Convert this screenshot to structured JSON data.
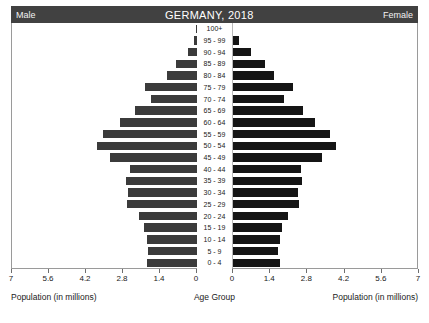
{
  "header": {
    "left_label": "Male",
    "title": "GERMANY, 2018",
    "right_label": "Female"
  },
  "footer": {
    "left_caption": "Population (in millions)",
    "center_caption": "Age Group",
    "right_caption": "Population (in millions)"
  },
  "axis": {
    "left_ticks": [
      "7",
      "5.6",
      "4.2",
      "2.8",
      "1.4",
      "0"
    ],
    "right_ticks": [
      "0",
      "1.4",
      "2.8",
      "4.2",
      "5.6",
      "7"
    ],
    "max": 7,
    "tick_step": 1.4
  },
  "colors": {
    "male_bar": "#3b3b3b",
    "female_bar": "#151515",
    "header_bg": "#414141",
    "frame": "#9a9a9a",
    "page_bg": "#ffffff"
  },
  "chart_data": {
    "type": "bar",
    "title": "GERMANY, 2018",
    "subtitle": "",
    "xlabel": "Population (in millions)",
    "ylabel": "Age Group",
    "xlim": [
      0,
      7
    ],
    "grid": false,
    "legend_position": "header",
    "orientation": "horizontal",
    "layout": "population-pyramid",
    "categories": [
      "100+",
      "95 - 99",
      "90 - 94",
      "85 - 89",
      "80 - 84",
      "75 - 79",
      "70 - 74",
      "65 - 69",
      "60 - 64",
      "55 - 59",
      "50 - 54",
      "45 - 49",
      "40 - 44",
      "35 - 39",
      "30 - 34",
      "25 - 29",
      "20 - 24",
      "15 - 19",
      "10 - 14",
      "5 - 9",
      "0 - 4"
    ],
    "series": [
      {
        "name": "Male",
        "side": "left",
        "color": "#3b3b3b",
        "values": [
          0.02,
          0.12,
          0.35,
          0.78,
          1.15,
          1.95,
          1.75,
          2.35,
          2.9,
          3.55,
          3.8,
          3.3,
          2.55,
          2.7,
          2.6,
          2.65,
          2.2,
          2.0,
          1.9,
          1.85,
          1.9
        ]
      },
      {
        "name": "Female",
        "side": "right",
        "color": "#151515",
        "values": [
          0.05,
          0.28,
          0.7,
          1.25,
          1.6,
          2.3,
          1.95,
          2.7,
          3.15,
          3.7,
          3.95,
          3.4,
          2.6,
          2.65,
          2.5,
          2.55,
          2.1,
          1.9,
          1.8,
          1.75,
          1.8
        ]
      }
    ]
  }
}
